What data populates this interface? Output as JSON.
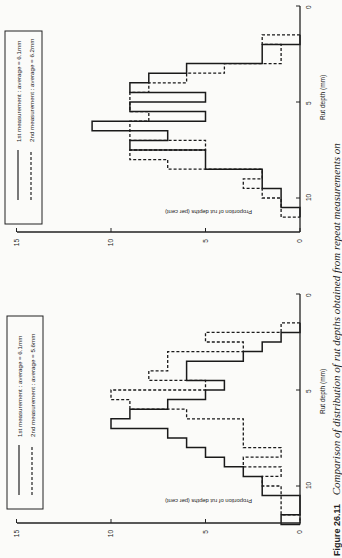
{
  "caption": {
    "label": "Figure 26.11",
    "text": "Comparison of distribution of rut depths obtained from repeat measurements on"
  },
  "chart_data": [
    {
      "type": "bar",
      "subtype": "histogram",
      "orientation": "rotated 90 degrees clockwise on page",
      "title": "",
      "xlabel": "Rut depth (mm)",
      "ylabel": "Proportion of rut depths (per cent)",
      "xlim": [
        0,
        12
      ],
      "ylim": [
        0,
        15
      ],
      "xticks": [
        0,
        5,
        10
      ],
      "yticks": [
        0,
        5,
        10,
        15
      ],
      "bin_width_mm": 0.5,
      "bin_starts": [
        1.5,
        2.0,
        2.5,
        3.0,
        3.5,
        4.0,
        4.5,
        5.0,
        5.5,
        6.0,
        6.5,
        7.0,
        7.5,
        8.0,
        8.5,
        9.0,
        9.5,
        10.0,
        10.5
      ],
      "legend_position": "top-left of chart (rotated)",
      "series": [
        {
          "name": "1st measurement : average = 6.1mm",
          "style": "solid",
          "values": [
            0,
            2,
            2,
            6,
            8,
            9,
            5,
            9,
            5,
            11,
            7,
            9,
            5,
            5,
            2,
            2,
            1,
            1,
            0
          ]
        },
        {
          "name": "2nd measurement : average = 6.2mm",
          "style": "dashed",
          "values": [
            2,
            1,
            1,
            4,
            6,
            8,
            9,
            9,
            8,
            9,
            9,
            5,
            9,
            7,
            2,
            3,
            2,
            1,
            1
          ]
        }
      ]
    },
    {
      "type": "bar",
      "subtype": "histogram",
      "orientation": "rotated 90 degrees clockwise on page",
      "title": "",
      "xlabel": "Rut depth (mm)",
      "ylabel": "Proportion of rut depths (per cent)",
      "xlim": [
        0,
        12
      ],
      "ylim": [
        0,
        15
      ],
      "xticks": [
        0,
        5,
        10
      ],
      "yticks": [
        0,
        5,
        10,
        15
      ],
      "bin_width_mm": 0.5,
      "bin_starts": [
        1.5,
        2.0,
        2.5,
        3.0,
        3.5,
        4.0,
        4.5,
        5.0,
        5.5,
        6.0,
        6.5,
        7.0,
        7.5,
        8.0,
        8.5,
        9.0,
        9.5,
        10.0,
        10.5,
        11.0,
        11.5
      ],
      "legend_position": "top-left of chart (rotated)",
      "series": [
        {
          "name": "1st measurement : average = 6.1mm",
          "style": "solid",
          "values": [
            0,
            1,
            2,
            3,
            6,
            6,
            4,
            5,
            7,
            9,
            10,
            7,
            6,
            5,
            4,
            3,
            2,
            2,
            0,
            0,
            1
          ]
        },
        {
          "name": "2nd measurement : average = 5.6mm",
          "style": "dashed",
          "values": [
            1,
            5,
            3,
            7,
            7,
            8,
            5,
            10,
            9,
            6,
            3,
            3,
            3,
            1,
            3,
            1,
            2,
            1,
            1,
            1,
            0
          ]
        }
      ]
    }
  ],
  "charts": [
    {
      "legend": {
        "items": [
          {
            "label": "1st measurement : average = 6.1mm",
            "style": "solid"
          },
          {
            "label": "2nd measurement : average = 6.2mm",
            "style": "dashed"
          }
        ]
      },
      "xlabel": "Rut depth (mm)",
      "ylabel": "Proportion of rut depths (per cent)",
      "xticks": [
        "0",
        "5",
        "10"
      ],
      "yticks": [
        "0",
        "5",
        "10",
        "15"
      ]
    },
    {
      "legend": {
        "items": [
          {
            "label": "1st measurement : average = 6.1mm",
            "style": "solid"
          },
          {
            "label": "2nd measurement : average = 5.6mm",
            "style": "dashed"
          }
        ]
      },
      "xlabel": "Rut depth (mm)",
      "ylabel": "Proportion of rut depths (per cent)",
      "xticks": [
        "0",
        "5",
        "10"
      ],
      "yticks": [
        "0",
        "5",
        "10",
        "15"
      ]
    }
  ]
}
